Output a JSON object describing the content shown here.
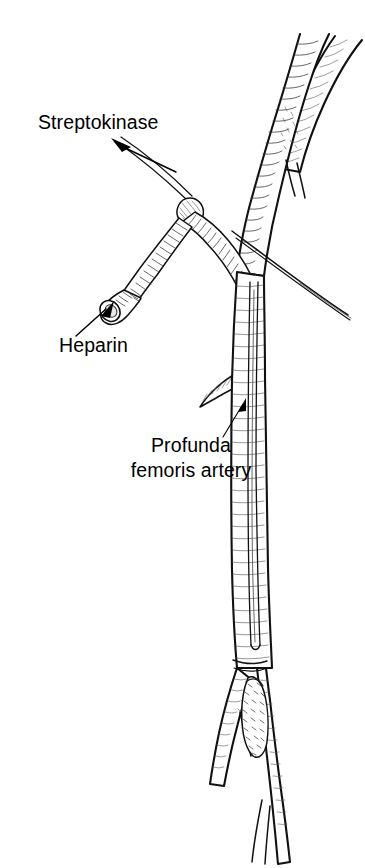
{
  "figure": {
    "type": "line-art medical illustration",
    "background_color": "#ffffff",
    "ink_color": "#111111"
  },
  "labels": [
    {
      "id": "streptokinase",
      "text": "Streptokinase",
      "x": 38,
      "y": 129,
      "anchor": "start",
      "points_to": "infusion-line",
      "arrow_from": [
        115,
        141
      ],
      "arrow_to": [
        177,
        170
      ]
    },
    {
      "id": "heparin",
      "text": "Heparin",
      "x": 59,
      "y": 352,
      "anchor": "start",
      "points_to": "heparin-port-hub",
      "arrow_from": [
        77,
        333
      ],
      "arrow_to": [
        110,
        305
      ]
    },
    {
      "id": "profunda-line-1",
      "text": "Profunda",
      "x": 191,
      "y": 452,
      "anchor": "middle",
      "points_to": "profunda-femoris-branch",
      "arrow_from": [
        228,
        432
      ],
      "arrow_to": [
        243,
        403
      ]
    },
    {
      "id": "profunda-line-2",
      "text": "femoris artery",
      "x": 191,
      "y": 477,
      "anchor": "middle",
      "points_to": "profunda-femoris-branch",
      "arrow_from": null,
      "arrow_to": null
    }
  ],
  "anatomy": [
    {
      "id": "common-femoral-artery",
      "name": "common femoral artery",
      "description": "main vessel descending from upper right to lower center"
    },
    {
      "id": "upper-branch-vessel",
      "name": "upper branch vessel",
      "description": "vessel branching toward upper right at top of image"
    },
    {
      "id": "profunda-femoris-branch",
      "name": "profunda femoris artery",
      "description": "branch leaving the main artery to the left"
    },
    {
      "id": "distal-bifurcation",
      "name": "distal bifurcation",
      "description": "vessel divides near the bottom of the image"
    },
    {
      "id": "thrombus",
      "name": "thrombus",
      "description": "stippled occlusive clot in the lumen at the distal bifurcation"
    }
  ],
  "devices": [
    {
      "id": "infusion-line",
      "name": "streptokinase infusion line",
      "description": "thin tubing entering the catheter hub from upper left"
    },
    {
      "id": "catheter-hub",
      "name": "Y-connector catheter hub",
      "description": "connector joining infusion line, heparin port and catheter"
    },
    {
      "id": "heparin-port-hub",
      "name": "heparin side port",
      "description": "flared open luer hub at the end of the side arm"
    },
    {
      "id": "intra-arterial-catheter",
      "name": "intra-arterial catheter",
      "description": "catheter running inside the arterial lumen down to the clot"
    },
    {
      "id": "guidewire",
      "name": "guidewire",
      "description": "tapering wire crossing diagonally to the lower right"
    }
  ]
}
